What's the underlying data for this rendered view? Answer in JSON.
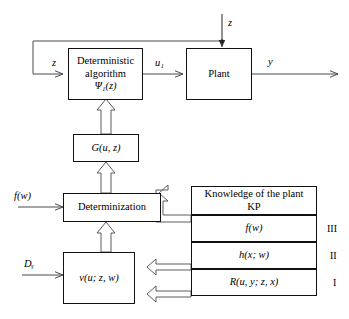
{
  "diagram": {
    "boxes": {
      "deterministic_algorithm": {
        "line1": "Deterministic",
        "line2": "algorithm",
        "line3": "Ψ₁(z)"
      },
      "plant": {
        "label": "Plant"
      },
      "g_function": {
        "label": "G(u, z)"
      },
      "determinization": {
        "label": "Determinization"
      },
      "v_function": {
        "label": "v(u; z, w)"
      },
      "knowledge": {
        "line1": "Knowledge of the plant",
        "line2": "KP"
      },
      "kp_row_f": {
        "label": "f(w)"
      },
      "kp_row_h": {
        "label": "h(x; w)"
      },
      "kp_row_r": {
        "label": "R(u, y; z, x)"
      }
    },
    "signals": {
      "z_feedback": "z",
      "z_disturbance": "z",
      "u1": "u₁",
      "y": "y",
      "f_w": "f(w)",
      "d_y": "Dᵧ"
    },
    "levels": {
      "three": "III",
      "two": "II",
      "one": "I"
    }
  }
}
